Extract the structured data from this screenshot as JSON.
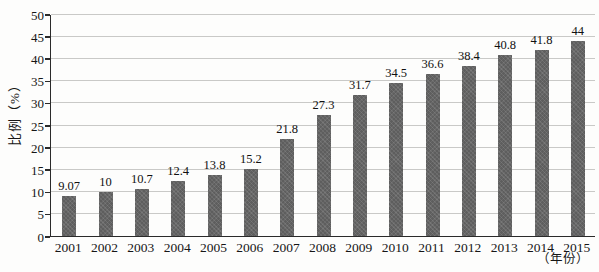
{
  "chart_data": {
    "type": "bar",
    "title": "",
    "categories": [
      "2001",
      "2002",
      "2003",
      "2004",
      "2005",
      "2006",
      "2007",
      "2008",
      "2009",
      "2010",
      "2011",
      "2012",
      "2013",
      "2014",
      "2015"
    ],
    "values": [
      9.07,
      10,
      10.7,
      12.4,
      13.8,
      15.2,
      21.8,
      27.3,
      31.7,
      34.5,
      36.6,
      38.4,
      40.8,
      41.8,
      44
    ],
    "value_labels": [
      "9.07",
      "10",
      "10.7",
      "12.4",
      "13.8",
      "15.2",
      "21.8",
      "27.3",
      "31.7",
      "34.5",
      "36.6",
      "38.4",
      "40.8",
      "41.8",
      "44"
    ],
    "ylabel": "比例（%）",
    "xlabel": "（年份）",
    "ylim": [
      0,
      50
    ],
    "ytick_step": 5,
    "yticks": [
      "0",
      "5",
      "10",
      "15",
      "20",
      "25",
      "30",
      "35",
      "40",
      "45",
      "50"
    ],
    "grid": "horizontal",
    "legend": "none",
    "bar_color": "#5e5e5e",
    "grid_color": "#c9c9c7",
    "axis_color": "#2a2a2a"
  }
}
